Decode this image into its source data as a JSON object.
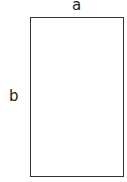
{
  "diagram": {
    "shape": "rectangle",
    "labels": {
      "top": "a",
      "left": "b"
    },
    "stroke_color": "#333333"
  }
}
